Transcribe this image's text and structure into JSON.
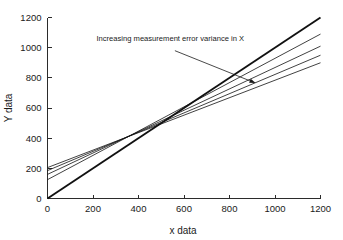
{
  "chart_data": {
    "type": "line",
    "title": "",
    "xlabel": "x data",
    "ylabel": "Y data",
    "xlim": [
      0,
      1200
    ],
    "ylim": [
      0,
      1200
    ],
    "xticks": [
      0,
      200,
      400,
      600,
      800,
      1000,
      1200
    ],
    "yticks": [
      0,
      200,
      400,
      600,
      800,
      1000,
      1200
    ],
    "xticklabels": [
      "0",
      "200",
      "400",
      "600",
      "800",
      "1000",
      "1200"
    ],
    "yticklabels": [
      "0",
      "200",
      "400",
      "600",
      "800",
      "1000",
      "1200"
    ],
    "grid": false,
    "legend": "none",
    "pivot_point": [
      480,
      480
    ],
    "annotations": [
      {
        "text": "Increasing measurement error variance in X",
        "text_x": 215,
        "text_y": 1045,
        "arrow_from": [
          560,
          980
        ],
        "arrow_to": [
          915,
          765
        ]
      }
    ],
    "series": [
      {
        "name": "no error (true 1:1 line)",
        "intercept": 0,
        "slope": 1.0,
        "x": [
          0,
          1200
        ],
        "values": [
          0,
          1200
        ],
        "emphasis": true
      },
      {
        "name": "error variance level 1",
        "intercept": 125,
        "slope": 0.804,
        "x": [
          0,
          1200
        ],
        "values": [
          125,
          1090
        ],
        "emphasis": false
      },
      {
        "name": "error variance level 2",
        "intercept": 160,
        "slope": 0.708,
        "x": [
          0,
          1200
        ],
        "values": [
          160,
          1010
        ],
        "emphasis": false
      },
      {
        "name": "error variance level 3",
        "intercept": 185,
        "slope": 0.638,
        "x": [
          0,
          1200
        ],
        "values": [
          185,
          950
        ],
        "emphasis": false
      },
      {
        "name": "error variance level 4",
        "intercept": 205,
        "slope": 0.579,
        "x": [
          0,
          1200
        ],
        "values": [
          205,
          900
        ],
        "emphasis": false
      }
    ]
  },
  "colors": {
    "background": "#ffffff",
    "axis": "#2b2b2b",
    "line": "#111111",
    "text": "#1a1a1a"
  }
}
